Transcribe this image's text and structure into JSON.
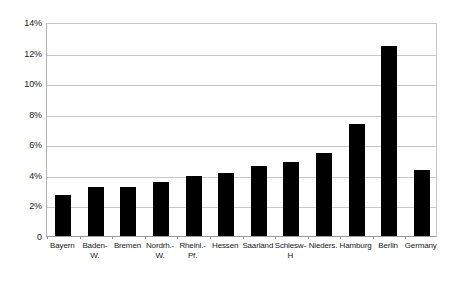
{
  "chart_data": {
    "type": "bar",
    "title": "",
    "subtitle": "",
    "xlabel": "",
    "ylabel": "",
    "categories": [
      "Bayern",
      "Baden-W.",
      "Bremen",
      "Nordrh.-W.",
      "Rheinl.-Pf.",
      "Hessen",
      "Saarland",
      "Schlesw-H",
      "Nieders.",
      "Hamburg",
      "Berlin",
      "Germany"
    ],
    "category_lines": [
      [
        "Bayern"
      ],
      [
        "Baden-",
        "W."
      ],
      [
        "Bremen"
      ],
      [
        "Nordrh.-",
        "W."
      ],
      [
        "Rheinl.-",
        "Pf."
      ],
      [
        "Hessen"
      ],
      [
        "Saarland"
      ],
      [
        "Schlesw-",
        "H"
      ],
      [
        "Nieders."
      ],
      [
        "Hamburg"
      ],
      [
        "Berlin"
      ],
      [
        "Germany"
      ]
    ],
    "values": [
      2.7,
      3.2,
      3.2,
      3.55,
      3.95,
      4.15,
      4.6,
      4.85,
      5.45,
      7.3,
      12.4,
      4.3
    ],
    "value_labels": [
      "2.7%",
      "3.2%",
      "3.2%",
      "3.55%",
      "3.95%",
      "4.15%",
      "4.6%",
      "4.85%",
      "5.45%",
      "7.3%",
      "12.4%",
      "4.3%"
    ],
    "ylim": [
      0,
      14
    ],
    "yticks": [
      0,
      2,
      4,
      6,
      8,
      10,
      12,
      14
    ],
    "ytick_labels": [
      "0",
      "2%",
      "4%",
      "6%",
      "8%",
      "10%",
      "12%",
      "14%"
    ],
    "grid": true,
    "legend": "none",
    "bar_color": "#000000",
    "grid_color": "#c9c9c9",
    "axis_color": "#9a9a9a",
    "background_color": "#ffffff"
  }
}
